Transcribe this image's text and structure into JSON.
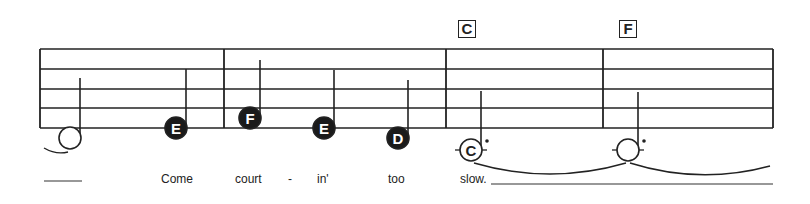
{
  "chords": [
    {
      "label": "C",
      "x": 458
    },
    {
      "label": "F",
      "x": 619
    }
  ],
  "staff": {
    "x_start": 40,
    "x_end": 773,
    "lines_y": [
      49,
      69,
      89,
      108,
      128
    ],
    "barlines_x": [
      40,
      224,
      446,
      603,
      773
    ]
  },
  "notes": [
    {
      "letter": "",
      "filled": false,
      "x": 70,
      "y": 138,
      "stem_top": 78,
      "dotted": false,
      "ledger": false
    },
    {
      "letter": "E",
      "filled": true,
      "x": 176,
      "y": 128,
      "stem_top": 69,
      "dotted": false,
      "ledger": false
    },
    {
      "letter": "F",
      "filled": true,
      "x": 250,
      "y": 118,
      "stem_top": 60,
      "dotted": false,
      "ledger": false
    },
    {
      "letter": "E",
      "filled": true,
      "x": 324,
      "y": 128,
      "stem_top": 70,
      "dotted": false,
      "ledger": false
    },
    {
      "letter": "D",
      "filled": true,
      "x": 398,
      "y": 138,
      "stem_top": 80,
      "dotted": false,
      "ledger": false
    },
    {
      "letter": "C",
      "filled": false,
      "x": 471,
      "y": 150,
      "stem_top": 91,
      "dotted": true,
      "ledger": true
    },
    {
      "letter": "",
      "filled": false,
      "x": 628,
      "y": 150,
      "stem_top": 92,
      "dotted": true,
      "ledger": true
    }
  ],
  "lyrics": [
    {
      "text": "Come",
      "x": 161
    },
    {
      "text": "court",
      "x": 235
    },
    {
      "text": "-",
      "x": 288
    },
    {
      "text": "in'",
      "x": 317
    },
    {
      "text": "too",
      "x": 388
    },
    {
      "text": "slow.",
      "x": 460
    }
  ],
  "extender_lines": [
    {
      "x1": 44,
      "x2": 82,
      "y": 181
    },
    {
      "x1": 491,
      "x2": 773,
      "y": 184
    }
  ]
}
